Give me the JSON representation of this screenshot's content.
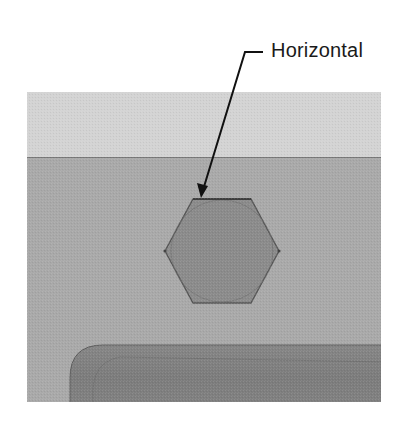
{
  "figure": {
    "callout": {
      "label": "Horizontal",
      "line_color": "#111111",
      "label_color": "#1a1a1a"
    },
    "panel": {
      "top_band_color": "#d3d3d3",
      "middle_band_color": "#a9a9a9",
      "band_divider_color": "#7a7a7a"
    },
    "hexagon": {
      "fill": "#8b8b8b",
      "stroke": "#5a5a5a",
      "inscribed_circle_stroke": "#6e6e6e",
      "constraint": "Horizontal"
    },
    "rounded_body": {
      "fill": "#7f7f7f",
      "stroke": "#5c5c5c"
    }
  }
}
